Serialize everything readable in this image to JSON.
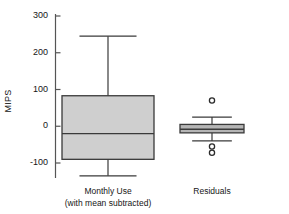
{
  "chart_data": {
    "type": "box",
    "title": "",
    "xlabel": "",
    "ylabel": "MIPS",
    "ylim": [
      -150,
      310
    ],
    "yticks": [
      300,
      200,
      100,
      0,
      -100
    ],
    "ytick_labels": [
      "300",
      "200",
      "100",
      "0",
      "-100"
    ],
    "grid": false,
    "legend": null,
    "categories": [
      "Monthly Use",
      "Residuals"
    ],
    "category_sublabels": [
      "(with mean subtracted)",
      ""
    ],
    "boxes": [
      {
        "name": "Monthly Use",
        "sublabel": "(with mean subtracted)",
        "whisker_high": 245,
        "q3": 83,
        "median": -20,
        "q1": -90,
        "whisker_low": -135,
        "outliers": [],
        "fill": "#cfcfcf",
        "stroke": "#3a3a3a"
      },
      {
        "name": "Residuals",
        "sublabel": "",
        "whisker_high": 25,
        "q3": 5,
        "median": -8,
        "q1": -18,
        "whisker_low": -40,
        "outliers": [
          70,
          -55,
          -72
        ],
        "fill": "#b5b5b5",
        "stroke": "#3a3a3a"
      }
    ],
    "colors": {
      "axis": "#555555",
      "box_stroke": "#3a3a3a",
      "box_fill_1": "#cfcfcf",
      "box_fill_2": "#b5b5b5",
      "outlier_stroke": "#2b2b2b",
      "background": "#ffffff"
    }
  }
}
